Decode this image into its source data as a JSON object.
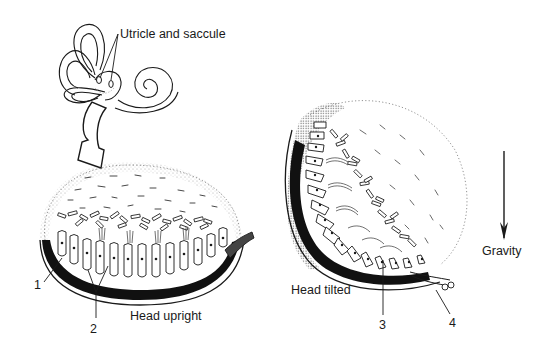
{
  "figure": {
    "panels": [
      {
        "id": "head-upright",
        "caption": "Head upright",
        "callouts": [
          {
            "number": "1"
          },
          {
            "number": "2"
          }
        ]
      },
      {
        "id": "head-tilted",
        "caption": "Head tilted",
        "callouts": [
          {
            "number": "3"
          },
          {
            "number": "4"
          }
        ]
      }
    ],
    "inner_ear_label": "Utricle and saccule",
    "gravity_label": "Gravity",
    "colors": {
      "ink": "#1a1a1a",
      "background": "#ffffff",
      "stipple": "#7a7a7a"
    }
  }
}
